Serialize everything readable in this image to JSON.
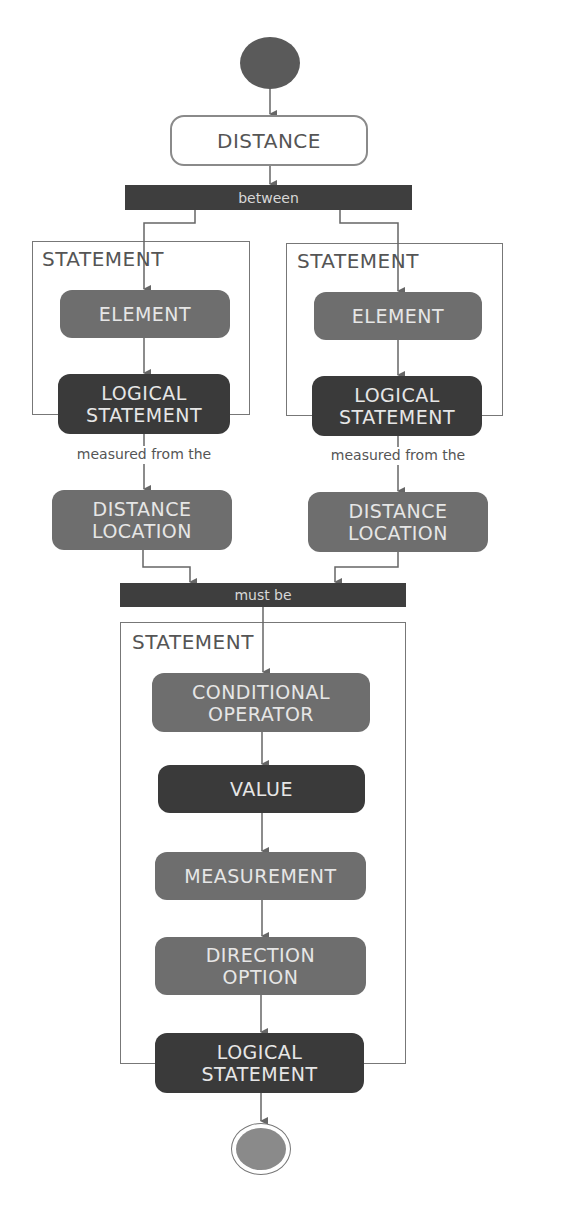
{
  "diagram": {
    "type": "UML activity diagram",
    "start": {
      "label": ""
    },
    "distance": {
      "label": "DISTANCE"
    },
    "fork_bar": {
      "label": "between"
    },
    "left_branch": {
      "container_title": "STATEMENT",
      "element": "ELEMENT",
      "logical_statement": "LOGICAL STATEMENT",
      "edge_label": "measured from the",
      "distance_location": "DISTANCE LOCATION"
    },
    "right_branch": {
      "container_title": "STATEMENT",
      "element": "ELEMENT",
      "logical_statement": "LOGICAL STATEMENT",
      "edge_label": "measured from the",
      "distance_location": "DISTANCE LOCATION"
    },
    "join_bar": {
      "label": "must be"
    },
    "bottom_statement": {
      "container_title": "STATEMENT",
      "conditional_operator": "CONDITIONAL OPERATOR",
      "value": "VALUE",
      "measurement": "MEASUREMENT",
      "direction_option": "DIRECTION OPTION",
      "logical_statement": "LOGICAL STATEMENT"
    },
    "end": {
      "label": ""
    },
    "colors": {
      "mid_node": "#6e6e6e",
      "dark_node": "#3a3a3a",
      "bar": "#3e3e3e",
      "line": "#666666"
    }
  }
}
